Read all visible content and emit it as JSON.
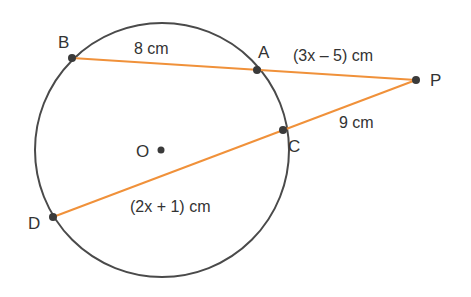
{
  "diagram": {
    "colors": {
      "circle": "#4a4a4a",
      "secant": "#f0913a",
      "point": "#3a3a3a",
      "text": "#333333"
    },
    "points": {
      "B": "B",
      "A": "A",
      "P": "P",
      "C": "C",
      "D": "D",
      "O": "O"
    },
    "measures": {
      "BA": "8 cm",
      "AP": "(3x – 5) cm",
      "CP": "9 cm",
      "DC": "(2x + 1) cm"
    }
  }
}
